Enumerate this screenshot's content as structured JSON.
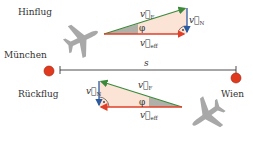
{
  "labels": {
    "outbound": "Hinflug",
    "return": "Rückflug",
    "city_start": "München",
    "city_end": "Wien",
    "distance": "s"
  },
  "vectors": {
    "plane_velocity": {
      "symbol": "v",
      "subscript": "F",
      "color": "#3a8a3a"
    },
    "wind_velocity": {
      "symbol": "v",
      "subscript": "N",
      "color": "#2c5aa0"
    },
    "effective_velocity": {
      "symbol": "v",
      "subscript": "eff",
      "color": "#e0402a"
    },
    "angle": "φ"
  },
  "colors": {
    "triangle_fill": "#fbe3d6",
    "angle_fill": "#b0b0a8",
    "city_dot": "#e03a1e",
    "plane": "#a8a8a8"
  }
}
